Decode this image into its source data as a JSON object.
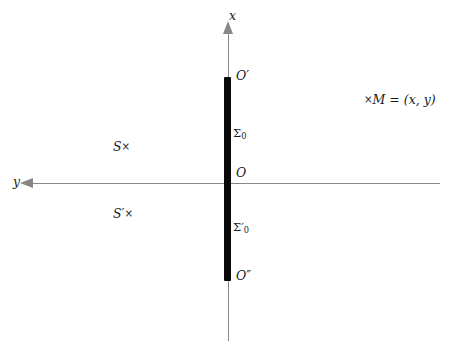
{
  "figure": {
    "type": "coordinate-diagram",
    "background_color": "#ffffff",
    "axis_color": "#878787",
    "bar_color": "#0a0a0a",
    "label_color": "#1a1a1a"
  },
  "axes": {
    "vertical": {
      "label": "x",
      "direction": "up",
      "arrow": "arrow-up"
    },
    "horizontal": {
      "label": "y",
      "direction": "left",
      "arrow": "arrow-left"
    }
  },
  "labels": {
    "o_prime": "O",
    "o_prime_mark": "′",
    "origin": "O",
    "o_double_prime": "O",
    "o_double_prime_mark": "″",
    "sigma_upper": "Σ",
    "sigma_upper_sub": "0",
    "sigma_lower": "Σ",
    "sigma_lower_mark": "′",
    "sigma_lower_sub": "0",
    "s": "S",
    "s_marker": "×",
    "s_prime": "S",
    "s_prime_mark": "′",
    "s_prime_marker": "×",
    "m_marker": "×",
    "m_text": "M = (x, y)"
  },
  "segment": {
    "name": "thick-bar",
    "from_label": "O′",
    "to_label": "O″",
    "through_label": "O"
  }
}
